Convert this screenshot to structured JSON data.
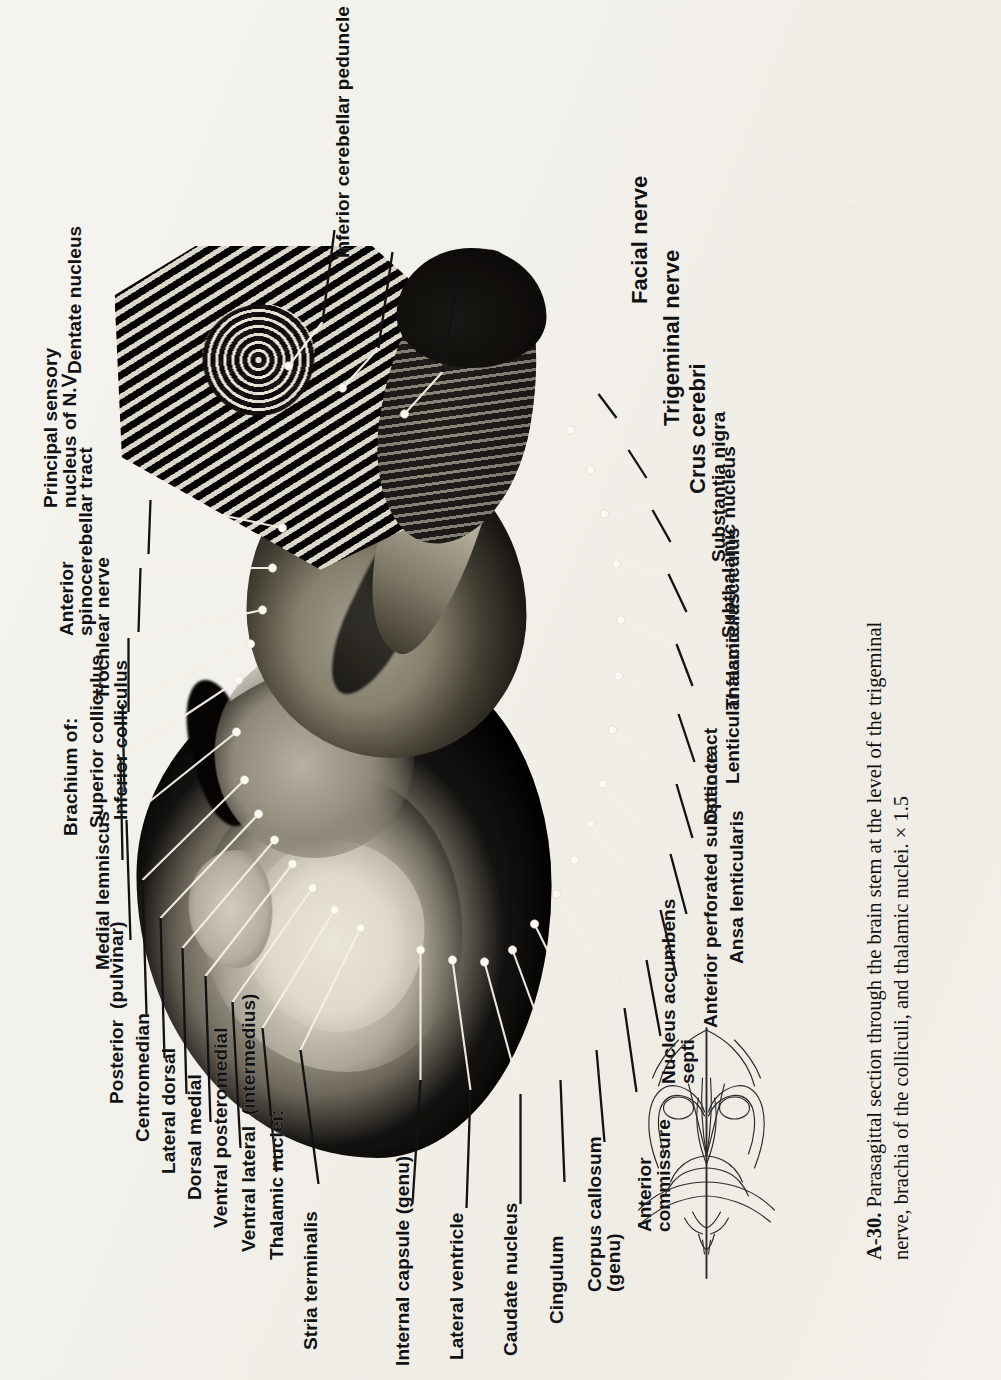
{
  "figure": {
    "number": "A-30.",
    "caption_line1": "Parasagittal section through the brain stem at the level of the trigeminal",
    "caption_line2": "nerve, brachia of the colliculi, and thalamic nuclei.",
    "magnification": "× 1.5"
  },
  "labels": {
    "stria_terminalis": "Stria terminalis",
    "internal_capsule": "Internal capsule (genu)",
    "lateral_ventricle": "Lateral ventricle",
    "caudate_nucleus": "Caudate nucleus",
    "cingulum": "Cingulum",
    "corpus_callosum_l1": "Corpus callosum",
    "corpus_callosum_l2": "(genu)",
    "anterior_commissure_l1": "Anterior",
    "anterior_commissure_l2": "commissure",
    "nucleus_accumbens_l1": "Nucleus accumbens",
    "nucleus_accumbens_l2": "septi",
    "anterior_perforated_substance": "Anterior perforated substance",
    "ansa_lenticularis": "Ansa lenticularis",
    "optic_tract": "Optic tract",
    "lenticular_fasciculus": "Lenticular fasciculus",
    "thalamic_fasciculus": "Thalamic fasciculus",
    "subthalamic_nucleus": "Subthalamic nucleus",
    "substantia_nigra": "Substantia nigra",
    "crus_cerebri": "Crus cerebri",
    "trigeminal_nerve": "Trigeminal nerve",
    "facial_nerve": "Facial nerve",
    "thalamic_nuclei_header": "Thalamic nuclei:",
    "ventral_lateral": "Ventral lateral  (intermedius)",
    "ventral_posteromedial": "Ventral posteromedial",
    "dorsal_medial": "Dorsal medial",
    "lateral_dorsal": "Lateral dorsal",
    "centromedian": "Centromedian",
    "posterior_pulvinar": "Posterior  (pulvinar)",
    "medial_lemniscus": "Medial lemniscus",
    "brachium_of": "Brachium of:",
    "superior_colliculus": "Superior colliculus",
    "inferior_colliculus": "Inferior colliculus",
    "trochlear_nerve": "Trochlear nerve",
    "anterior_spino_l1": "Anterior",
    "anterior_spino_l2": "spinocerebellar tract",
    "principal_sensory_l1": "Principal sensory",
    "principal_sensory_l2": "nucleus of N.Ⅴ",
    "dentate_nucleus": "Dentate nucleus",
    "inferior_cerebellar_peduncle": "Inferior cerebellar peduncle"
  },
  "colors": {
    "ink": "#111111",
    "paper": "#f4f1ec",
    "leader": "#f2efe6",
    "leader_dark": "#101010"
  },
  "inset": {
    "name": "brain-stem-orientation-diagram",
    "description": "dorsal view line drawing of brain stem with section plane line"
  }
}
